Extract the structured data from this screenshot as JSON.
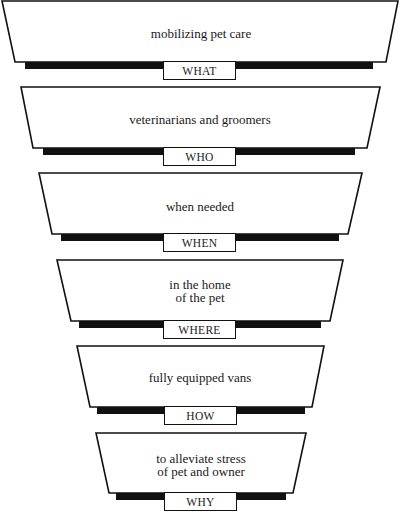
{
  "diagram": {
    "type": "funnel",
    "stages": [
      {
        "tag": "WHAT",
        "lines": [
          "mobilizing pet care"
        ]
      },
      {
        "tag": "WHO",
        "lines": [
          "veterinarians and groomers"
        ]
      },
      {
        "tag": "WHEN",
        "lines": [
          "when needed"
        ]
      },
      {
        "tag": "WHERE",
        "lines": [
          "in the home",
          "of the pet"
        ]
      },
      {
        "tag": "HOW",
        "lines": [
          "fully equipped vans"
        ]
      },
      {
        "tag": "WHY",
        "lines": [
          "to alleviate stress",
          "of pet and owner"
        ]
      }
    ]
  }
}
